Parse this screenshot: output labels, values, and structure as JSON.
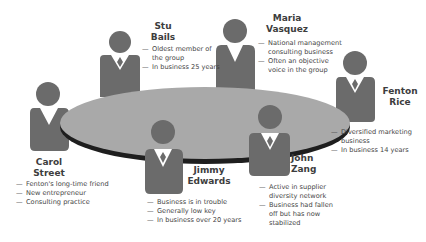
{
  "colors": {
    "person": "#6b6b6b",
    "table_top": "#a9a9a9",
    "table_edge": "#1e1e1e",
    "tie": "#6b6b6b",
    "collar": "#ffffff",
    "text": "#3d3d3d"
  },
  "people": [
    {
      "id": "stu-bails",
      "name_line1": "Stu",
      "name_line2": "Bails",
      "notes": [
        "Oldest member of the group",
        "In business 25 years"
      ]
    },
    {
      "id": "maria-vasquez",
      "name_line1": "Maria",
      "name_line2": "Vasquez",
      "notes": [
        "National management consulting business",
        "Often an objective voice in the group"
      ]
    },
    {
      "id": "fenton-rice",
      "name_line1": "Fenton",
      "name_line2": "Rice",
      "notes": [
        "Diversified marketing business",
        "In business 14 years"
      ]
    },
    {
      "id": "carol-street",
      "name_line1": "Carol",
      "name_line2": "Street",
      "notes": [
        "Fenton's long-time friend",
        "New entrepreneur",
        "Consulting practice"
      ]
    },
    {
      "id": "jimmy-edwards",
      "name_line1": "Jimmy",
      "name_line2": "Edwards",
      "notes": [
        "Business is in trouble",
        "Generally low key",
        "In business over 20 years"
      ]
    },
    {
      "id": "john-zang",
      "name_line1": "John",
      "name_line2": "Zang",
      "notes": [
        "Active in supplier diversity network",
        "Business had fallen off but has now stabilized"
      ]
    }
  ]
}
